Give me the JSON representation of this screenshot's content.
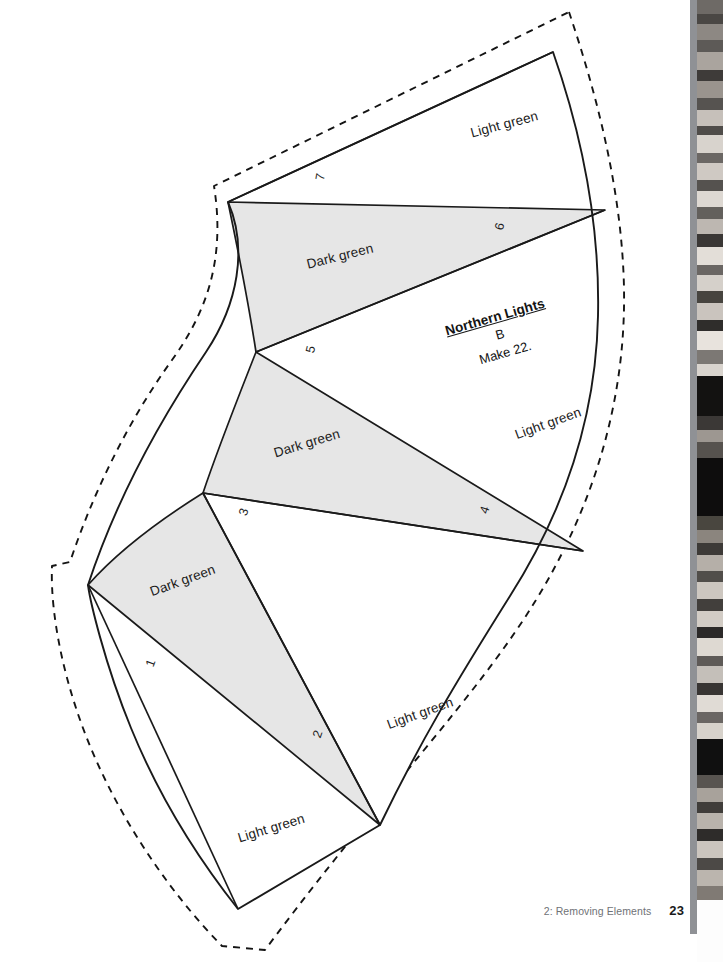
{
  "page": {
    "background_color": "#ffffff",
    "width": 723,
    "height": 962
  },
  "footer": {
    "section_label": "2: Removing Elements",
    "page_number": "23"
  },
  "pattern": {
    "title": "Northern Lights",
    "unit_letter": "B",
    "make_instruction": "Make 22.",
    "cut_line_style": "dashed",
    "sew_line_style": "solid",
    "dark_fill_color": "#e6e6e6",
    "light_fill_color": "#ffffff",
    "line_color": "#1a1a1a",
    "pieces": [
      {
        "number": "1",
        "fabric": "Light green",
        "num_x": 243,
        "num_y": 657,
        "num_rot": -70,
        "lbl_x": 146,
        "lbl_y": 576,
        "lbl_rot": -22,
        "show_label": false
      },
      {
        "number": "2",
        "fabric": "Dark green",
        "num_x": 310,
        "num_y": 735,
        "num_rot": -70,
        "lbl_x": 148,
        "lbl_y": 585,
        "lbl_rot": -20,
        "show_label": true
      },
      {
        "number": "3",
        "fabric": "Light green",
        "num_x": 236,
        "num_y": 513,
        "num_rot": -72,
        "lbl_x": 385,
        "lbl_y": 718,
        "lbl_rot": -20,
        "show_label": true
      },
      {
        "number": "4",
        "fabric": "Light green",
        "num_x": 477,
        "num_y": 511,
        "num_rot": -72,
        "lbl_x": 513,
        "lbl_y": 428,
        "lbl_rot": -20,
        "show_label": true
      },
      {
        "number": "5",
        "fabric": "Dark green",
        "num_x": 303,
        "num_y": 351,
        "num_rot": -76,
        "lbl_x": 272,
        "lbl_y": 446,
        "lbl_rot": -17,
        "show_label": true
      },
      {
        "number": "6",
        "fabric": "Dark green",
        "num_x": 492,
        "num_y": 228,
        "num_rot": -76,
        "lbl_x": 305,
        "lbl_y": 257,
        "lbl_rot": -14,
        "show_label": true
      },
      {
        "number": "7",
        "fabric": "Light green",
        "num_x": 313,
        "num_y": 179,
        "num_rot": -80,
        "lbl_x": 469,
        "lbl_y": 126,
        "lbl_rot": -15,
        "show_label": true
      }
    ],
    "bottom_label": {
      "fabric": "Light green",
      "lbl_x": 236,
      "lbl_y": 831,
      "lbl_rot": -17
    }
  },
  "photo_strip": {
    "rule_color": "#8f9195",
    "description": "quilt-photo-edge",
    "bands": [
      {
        "top": 0,
        "height": 14,
        "color": "#6e6a66"
      },
      {
        "top": 14,
        "height": 10,
        "color": "#4a4744"
      },
      {
        "top": 24,
        "height": 16,
        "color": "#8d8883"
      },
      {
        "top": 40,
        "height": 12,
        "color": "#5d5a57"
      },
      {
        "top": 52,
        "height": 18,
        "color": "#aaa49e"
      },
      {
        "top": 70,
        "height": 11,
        "color": "#3e3b39"
      },
      {
        "top": 81,
        "height": 17,
        "color": "#9a948e"
      },
      {
        "top": 98,
        "height": 12,
        "color": "#565350"
      },
      {
        "top": 110,
        "height": 16,
        "color": "#c6c0ba"
      },
      {
        "top": 126,
        "height": 9,
        "color": "#4f4c49"
      },
      {
        "top": 135,
        "height": 18,
        "color": "#d8d3cd"
      },
      {
        "top": 153,
        "height": 10,
        "color": "#6b6764"
      },
      {
        "top": 163,
        "height": 17,
        "color": "#cfc9c3"
      },
      {
        "top": 180,
        "height": 11,
        "color": "#55524f"
      },
      {
        "top": 191,
        "height": 16,
        "color": "#ddd8d2"
      },
      {
        "top": 207,
        "height": 12,
        "color": "#63605c"
      },
      {
        "top": 219,
        "height": 15,
        "color": "#bdb7b1"
      },
      {
        "top": 234,
        "height": 13,
        "color": "#3a3735"
      },
      {
        "top": 247,
        "height": 18,
        "color": "#e3ded8"
      },
      {
        "top": 265,
        "height": 10,
        "color": "#6a6663"
      },
      {
        "top": 275,
        "height": 16,
        "color": "#d5d0ca"
      },
      {
        "top": 291,
        "height": 12,
        "color": "#47443f"
      },
      {
        "top": 303,
        "height": 17,
        "color": "#cac4be"
      },
      {
        "top": 320,
        "height": 11,
        "color": "#2f2d2b"
      },
      {
        "top": 331,
        "height": 19,
        "color": "#e8e3dd"
      },
      {
        "top": 350,
        "height": 14,
        "color": "#7c7874"
      },
      {
        "top": 364,
        "height": 12,
        "color": "#d9d4ce"
      },
      {
        "top": 376,
        "height": 40,
        "color": "#131211"
      },
      {
        "top": 416,
        "height": 14,
        "color": "#3b3836"
      },
      {
        "top": 430,
        "height": 12,
        "color": "#9d9791"
      },
      {
        "top": 442,
        "height": 16,
        "color": "#56524e"
      },
      {
        "top": 458,
        "height": 58,
        "color": "#0e0d0d"
      },
      {
        "top": 516,
        "height": 14,
        "color": "#49463f"
      },
      {
        "top": 530,
        "height": 13,
        "color": "#8b857e"
      },
      {
        "top": 543,
        "height": 12,
        "color": "#3d3a37"
      },
      {
        "top": 555,
        "height": 16,
        "color": "#b5afa8"
      },
      {
        "top": 571,
        "height": 11,
        "color": "#514e4a"
      },
      {
        "top": 582,
        "height": 17,
        "color": "#cdc7c0"
      },
      {
        "top": 599,
        "height": 12,
        "color": "#423f3c"
      },
      {
        "top": 611,
        "height": 16,
        "color": "#d2ccc5"
      },
      {
        "top": 627,
        "height": 11,
        "color": "#2b2928"
      },
      {
        "top": 638,
        "height": 18,
        "color": "#ded9d2"
      },
      {
        "top": 656,
        "height": 10,
        "color": "#5e5a57"
      },
      {
        "top": 666,
        "height": 17,
        "color": "#c4bfb9"
      },
      {
        "top": 683,
        "height": 12,
        "color": "#383533"
      },
      {
        "top": 695,
        "height": 17,
        "color": "#e0dbd5"
      },
      {
        "top": 712,
        "height": 11,
        "color": "#6a6663"
      },
      {
        "top": 723,
        "height": 16,
        "color": "#d7d2cb"
      },
      {
        "top": 739,
        "height": 36,
        "color": "#101010"
      },
      {
        "top": 775,
        "height": 13,
        "color": "#585450"
      },
      {
        "top": 788,
        "height": 14,
        "color": "#a8a29b"
      },
      {
        "top": 802,
        "height": 11,
        "color": "#403d3a"
      },
      {
        "top": 813,
        "height": 16,
        "color": "#b9b3ac"
      },
      {
        "top": 829,
        "height": 12,
        "color": "#2e2c2a"
      },
      {
        "top": 841,
        "height": 17,
        "color": "#cbc5be"
      },
      {
        "top": 858,
        "height": 12,
        "color": "#4c4946"
      },
      {
        "top": 870,
        "height": 16,
        "color": "#bbb5ae"
      },
      {
        "top": 886,
        "height": 14,
        "color": "#807a74"
      },
      {
        "top": 900,
        "height": 62,
        "color": "#fdfdfd"
      }
    ]
  }
}
